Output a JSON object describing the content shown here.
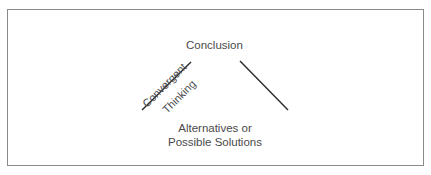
{
  "diagram": {
    "top_label": "Conclusion",
    "left_line_label_upper": "Convergent",
    "left_line_label_lower": "Thinking",
    "bottom_label_line1": "Alternatives or",
    "bottom_label_line2": "Possible Solutions"
  },
  "colors": {
    "line": "#2a2a2a",
    "text": "#4a4a4a",
    "border": "#8a8a8a"
  }
}
